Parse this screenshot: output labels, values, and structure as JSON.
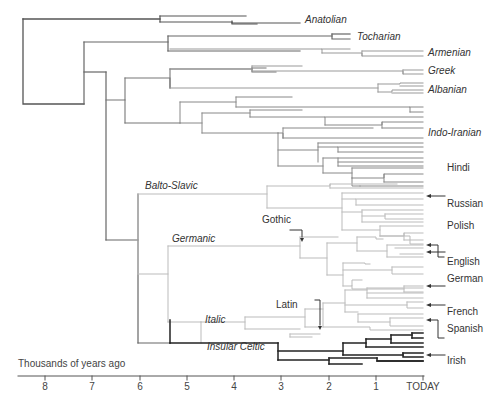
{
  "diagram": {
    "axis": {
      "label": "Thousands of years ago",
      "ticks": [
        "8",
        "7",
        "6",
        "5",
        "4",
        "3",
        "2",
        "1",
        "TODAY"
      ]
    },
    "branch_labels": {
      "anatolian": "Anatolian",
      "tocharian": "Tocharian",
      "armenian": "Armenian",
      "greek": "Greek",
      "albanian": "Albanian",
      "indo_iranian": "Indo-Iranian",
      "balto_slavic": "Balto-Slavic",
      "germanic": "Germanic",
      "italic": "Italic",
      "insular_celtic": "Insular Celtic"
    },
    "language_labels": {
      "hindi": "Hindi",
      "russian": "Russian",
      "polish": "Polish",
      "gothic": "Gothic",
      "english": "English",
      "german": "German",
      "latin": "Latin",
      "french": "French",
      "spanish": "Spanish",
      "irish": "Irish"
    },
    "colors": {
      "dark_branch": "#333333",
      "mid_branch": "#777777",
      "light_branch": "#bbbbbb",
      "text": "#333333"
    }
  }
}
